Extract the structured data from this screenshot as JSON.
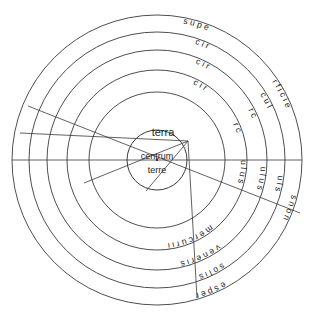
{
  "diagram": {
    "title": "terra",
    "type": "concentric-celestial-spheres",
    "center_circle": {
      "line1": "centrum",
      "line2": "terre"
    },
    "center_label": "terra",
    "geometry": {
      "center_x": 157,
      "center_y": 160,
      "ring_radii": [
        145,
        128,
        110,
        90,
        68
      ],
      "center_circle_radius": 30,
      "stroke_color": "#3a3a3a",
      "text_color": "#1d1d1d",
      "background_color": "#ffffff"
    },
    "rings": [
      {
        "index": 0,
        "radius": 145,
        "label": "superficies non esper",
        "top_text": "r f i c i e",
        "right_text": "s n o n",
        "bottom_text": "e s p e r",
        "left_text": "s u p e",
        "letters_clockwise": [
          "e",
          "r",
          "f",
          "i",
          "c",
          "i",
          "e",
          "s",
          "n",
          "o",
          "n",
          "e",
          "s",
          "p",
          "e",
          "r",
          "u",
          "s"
        ]
      },
      {
        "index": 1,
        "radius": 128,
        "label": "circulus",
        "top_text": "c u l",
        "right_text": "u l s",
        "bottom_text": "s o l i s",
        "left_text": "c i r",
        "letters_clockwise": [
          "c",
          "u",
          "l",
          "u",
          "l",
          "s",
          "s",
          "o",
          "l",
          "i",
          "s",
          "r",
          "i",
          "c"
        ]
      },
      {
        "index": 2,
        "radius": 110,
        "label": "circulus veneris",
        "top_text": "r c",
        "right_text": "u l u s",
        "bottom_text": "v e n e r i s",
        "left_text": "c i r",
        "letters_clockwise": [
          "r",
          "c",
          "u",
          "l",
          "u",
          "s",
          "s",
          "i",
          "r",
          "e",
          "n",
          "e",
          "v",
          "i",
          "c"
        ]
      },
      {
        "index": 3,
        "radius": 90,
        "label": "circulus mercurii",
        "top_text": "r c",
        "right_text": "u l u s",
        "bottom_text": "m e r c u r i i",
        "left_text": "c i r",
        "letters_clockwise": [
          "r",
          "c",
          "u",
          "l",
          "u",
          "s",
          "m",
          "e",
          "r",
          "c",
          "u",
          "r",
          "i",
          "i",
          "c"
        ]
      },
      {
        "index": 4,
        "radius": 68,
        "label": "inner orbit",
        "letters_clockwise": []
      }
    ],
    "chords": [
      {
        "name": "horizontal-diameter",
        "x1": 12,
        "y1": 160,
        "x2": 302,
        "y2": 160
      },
      {
        "name": "oblique-chord-1",
        "x1": 28,
        "y1": 106,
        "x2": 300,
        "y2": 213
      },
      {
        "name": "oblique-chord-2",
        "x1": 20,
        "y1": 133,
        "x2": 186,
        "y2": 140
      },
      {
        "name": "convergent-ray-1",
        "x1": 186,
        "y1": 142,
        "x2": 85,
        "y2": 182
      },
      {
        "name": "convergent-ray-2",
        "x1": 186,
        "y1": 142,
        "x2": 148,
        "y2": 190
      },
      {
        "name": "convergent-ray-3",
        "x1": 186,
        "y1": 142,
        "x2": 196,
        "y2": 297
      }
    ]
  }
}
